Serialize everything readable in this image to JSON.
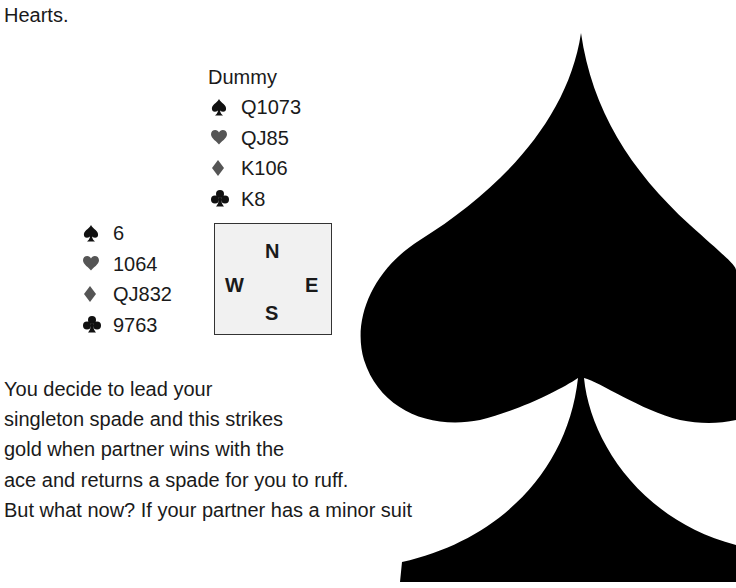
{
  "intro_text": "Hearts.",
  "dummy": {
    "title": "Dummy",
    "hand": [
      {
        "suit": "spades",
        "icon": "spade-icon",
        "color": "#111111",
        "cards": "Q1073"
      },
      {
        "suit": "hearts",
        "icon": "heart-icon",
        "color": "#555555",
        "cards": "QJ85"
      },
      {
        "suit": "diamonds",
        "icon": "diamond-icon",
        "color": "#555555",
        "cards": "K106"
      },
      {
        "suit": "clubs",
        "icon": "club-icon",
        "color": "#111111",
        "cards": "K8"
      }
    ]
  },
  "west": {
    "hand": [
      {
        "suit": "spades",
        "icon": "spade-icon",
        "color": "#111111",
        "cards": "6"
      },
      {
        "suit": "hearts",
        "icon": "heart-icon",
        "color": "#555555",
        "cards": "1064"
      },
      {
        "suit": "diamonds",
        "icon": "diamond-icon",
        "color": "#555555",
        "cards": "QJ832"
      },
      {
        "suit": "clubs",
        "icon": "club-icon",
        "color": "#111111",
        "cards": "9763"
      }
    ]
  },
  "compass": {
    "north": "N",
    "west": "W",
    "east": "E",
    "south": "S",
    "background": "#f1f1f1",
    "border": "#333333"
  },
  "body_lines": [
    "You decide to lead your",
    "singleton spade and this strikes",
    "gold when partner wins with the",
    "ace and returns a spade for you to ruff.",
    "But what now? If your partner has a minor suit"
  ],
  "decoration": {
    "icon": "large-spade-icon",
    "color": "#000000"
  }
}
